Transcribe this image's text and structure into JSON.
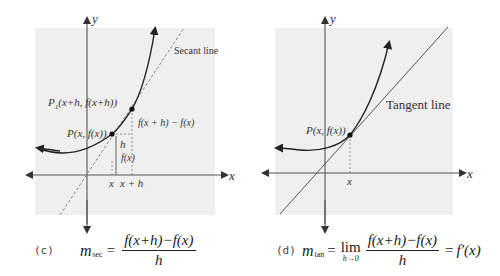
{
  "panel_c": {
    "axis_x_label": "x",
    "axis_y_label": "y",
    "secant_label": "Secant line",
    "point_p1_label_main": "P",
    "point_p1_label_sub": "1",
    "point_p1_label_rest": "(x+h, f(x+h))",
    "point_p_label": "P(x, f(x))",
    "diff_label": "f(x + h) − f(x)",
    "h_label": "h",
    "fx_label": "f(x)",
    "tick_x": "x",
    "tick_xh": "x + h",
    "caption_tag": "(c)",
    "formula": {
      "m": "m",
      "sub": "sec",
      "eq": "=",
      "numerator": "f(x+h)−f(x)",
      "denominator": "h"
    }
  },
  "panel_d": {
    "axis_x_label": "x",
    "axis_y_label": "y",
    "tangent_label": "Tangent line",
    "point_p_label": "P(x, f(x))",
    "tick_x": "x",
    "caption_tag": "(d)",
    "formula": {
      "m": "m",
      "sub": "tan",
      "eq": "=",
      "lim": "lim",
      "lim_sub": "h→0",
      "numerator": "f(x+h)−f(x)",
      "denominator": "h",
      "eq2": "=",
      "result": "f′(x)"
    }
  },
  "colors": {
    "panel_bg": "#efefef",
    "axis": "#555555",
    "curve": "#222222",
    "dashed": "#888888",
    "tangent": "#555555"
  }
}
